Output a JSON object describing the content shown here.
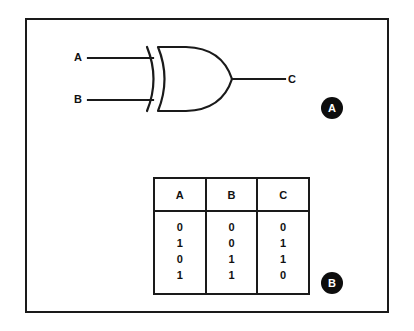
{
  "figure": {
    "panels": [
      {
        "badge": "A",
        "caption_role": "xor-gate-symbol"
      },
      {
        "badge": "B",
        "caption_role": "xor-truth-table"
      }
    ]
  },
  "circuit": {
    "gate_type": "XOR",
    "inputs": [
      {
        "label": "A"
      },
      {
        "label": "B"
      }
    ],
    "output": {
      "label": "C"
    }
  },
  "truth_table": {
    "headers": [
      "A",
      "B",
      "C"
    ],
    "columns": {
      "A": [
        "0",
        "1",
        "0",
        "1"
      ],
      "B": [
        "0",
        "0",
        "1",
        "1"
      ],
      "C": [
        "0",
        "1",
        "1",
        "0"
      ]
    },
    "rows": [
      [
        "0",
        "0",
        "0"
      ],
      [
        "1",
        "0",
        "1"
      ],
      [
        "0",
        "1",
        "1"
      ],
      [
        "1",
        "1",
        "0"
      ]
    ]
  },
  "colors": {
    "ink": "#1a1a1a",
    "background": "#ffffff",
    "badge_fill": "#0d0d0d",
    "badge_text": "#ffffff"
  }
}
